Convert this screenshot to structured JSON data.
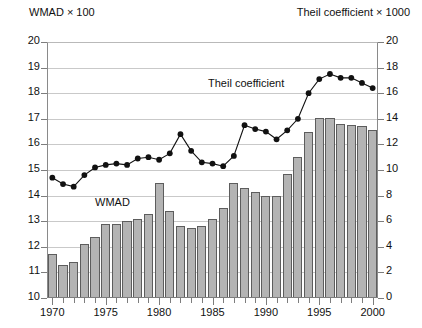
{
  "header": {
    "left_label": "WMAD × 100",
    "right_label": "Theil coefficient × 1000"
  },
  "annotations": {
    "theil": "Theil coefficient",
    "wmad": "WMAD"
  },
  "axes": {
    "left": {
      "min": 10,
      "max": 20,
      "step": 1,
      "ticks": [
        "10",
        "11",
        "12",
        "13",
        "14",
        "15",
        "16",
        "17",
        "18",
        "19",
        "20"
      ]
    },
    "right": {
      "min": 0,
      "max": 20,
      "step": 2,
      "ticks": [
        "0",
        "2",
        "4",
        "6",
        "8",
        "10",
        "12",
        "14",
        "16",
        "18",
        "20"
      ]
    },
    "x": {
      "min": 1970,
      "max": 2000,
      "tick_labels": [
        "1970",
        "1975",
        "1980",
        "1985",
        "1990",
        "1995",
        "2000"
      ]
    }
  },
  "colors": {
    "bar_fill": "#b4b4b4",
    "bar_stroke": "#5d5d5d",
    "line": "#111111",
    "grid": "#c9c9c9",
    "axis": "#7d7d7d"
  },
  "chart_data": {
    "type": "bar",
    "title": "",
    "subtitle": "",
    "xlabel": "",
    "ylabel": "WMAD × 100",
    "y2label": "Theil coefficient × 1000",
    "grid": true,
    "legend": "inline-annotations",
    "ylim": [
      10,
      20
    ],
    "y2lim": [
      0,
      20
    ],
    "xlim": [
      1970,
      2000
    ],
    "categories": [
      1970,
      1971,
      1972,
      1973,
      1974,
      1975,
      1976,
      1977,
      1978,
      1979,
      1980,
      1981,
      1982,
      1983,
      1984,
      1985,
      1986,
      1987,
      1988,
      1989,
      1990,
      1991,
      1992,
      1993,
      1994,
      1995,
      1996,
      1997,
      1998,
      1999,
      2000
    ],
    "series": [
      {
        "name": "WMAD",
        "type": "bar",
        "axis": "left",
        "units": "WMAD × 100",
        "values": [
          11.7,
          11.3,
          11.4,
          12.1,
          12.4,
          12.9,
          12.9,
          13.0,
          13.1,
          13.3,
          14.5,
          13.4,
          12.8,
          12.75,
          12.8,
          13.1,
          13.5,
          14.5,
          14.3,
          14.15,
          14.0,
          14.0,
          14.85,
          15.5,
          16.5,
          17.05,
          17.05,
          16.8,
          16.75,
          16.7,
          16.55
        ]
      },
      {
        "name": "Theil coefficient",
        "type": "line",
        "axis": "right",
        "units": "Theil coefficient × 1000",
        "values": [
          9.4,
          8.9,
          8.7,
          9.6,
          10.2,
          10.4,
          10.5,
          10.4,
          10.9,
          11.0,
          10.8,
          11.3,
          12.8,
          11.5,
          10.6,
          10.5,
          10.3,
          11.1,
          13.5,
          13.2,
          13.0,
          12.4,
          13.1,
          14.0,
          16.0,
          17.1,
          17.5,
          17.2,
          17.2,
          16.8,
          16.4
        ]
      }
    ]
  }
}
